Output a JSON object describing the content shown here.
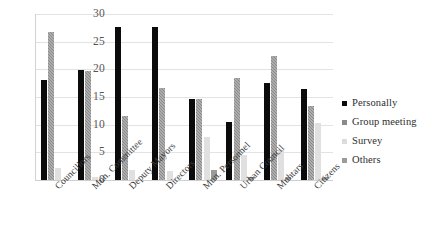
{
  "chart_data": {
    "type": "bar",
    "title": "",
    "subtitle": "",
    "xlabel": "",
    "ylabel": "",
    "ylim": [
      0,
      30
    ],
    "yticks": [
      30,
      25,
      20,
      15,
      10,
      5,
      0
    ],
    "grid": true,
    "legend_position": "right",
    "categories": [
      "Councillors",
      "Mun. Committee",
      "Deputy Mayors",
      "Directors",
      "Mun. Personnel",
      "Urban Council",
      "Muhtars",
      "Citizens"
    ],
    "series": [
      {
        "name": "Personally",
        "color": "#0b0b0b",
        "values": [
          18.0,
          19.8,
          27.7,
          27.6,
          14.6,
          10.5,
          17.5,
          16.4
        ]
      },
      {
        "name": "Group meeting",
        "color": "#8a8a8a",
        "values": [
          26.8,
          19.7,
          11.6,
          16.7,
          14.6,
          18.5,
          22.4,
          13.3
        ]
      },
      {
        "name": "Survey",
        "color": "#dcdcdc",
        "values": [
          2.1,
          0.6,
          1.9,
          1.7,
          7.7,
          4.5,
          5.5,
          10.3
        ]
      },
      {
        "name": "Others",
        "color": "#9b9b9b",
        "values": [
          0.0,
          0.0,
          0.0,
          0.0,
          1.8,
          0.6,
          0.6,
          0.5
        ]
      }
    ]
  },
  "legend": {
    "items": [
      {
        "label": "Personally"
      },
      {
        "label": "Group meeting"
      },
      {
        "label": "Survey"
      },
      {
        "label": "Others"
      }
    ]
  }
}
